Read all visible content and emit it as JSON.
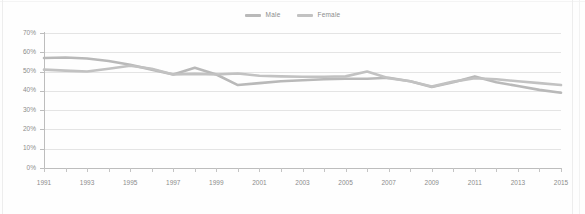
{
  "chart_data": {
    "type": "line",
    "title": "",
    "xlabel": "",
    "ylabel": "",
    "ylim": [
      0,
      70
    ],
    "ytick_labels": [
      "0%",
      "10%",
      "20%",
      "30%",
      "40%",
      "50%",
      "60%",
      "70%"
    ],
    "ytick_values": [
      0,
      10,
      20,
      30,
      40,
      50,
      60,
      70
    ],
    "grid": true,
    "legend_position": "top-center",
    "x": [
      1991,
      1992,
      1993,
      1994,
      1995,
      1996,
      1997,
      1998,
      1999,
      2000,
      2001,
      2002,
      2003,
      2004,
      2005,
      2006,
      2007,
      2008,
      2009,
      2010,
      2011,
      2012,
      2013,
      2014,
      2015
    ],
    "xtick_labels": [
      "1991",
      "",
      "1993",
      "",
      "1995",
      "",
      "1997",
      "",
      "1999",
      "",
      "2001",
      "",
      "2003",
      "",
      "2005",
      "",
      "2007",
      "",
      "2009",
      "",
      "2011",
      "",
      "2013",
      "",
      "2015"
    ],
    "series": [
      {
        "name": "Male",
        "color": "#b9b9b9",
        "values": [
          57.0,
          57.3,
          56.8,
          55.5,
          53.5,
          51.0,
          48.5,
          52.0,
          48.5,
          43.0,
          44.0,
          45.0,
          45.5,
          46.0,
          46.3,
          46.3,
          46.8,
          45.0,
          42.0,
          44.5,
          47.5,
          44.5,
          42.5,
          40.5,
          39.0
        ]
      },
      {
        "name": "Female",
        "color": "#c2c2c2",
        "values": [
          51.0,
          50.5,
          50.0,
          51.5,
          53.0,
          51.5,
          48.5,
          48.8,
          48.5,
          49.0,
          47.8,
          47.5,
          47.3,
          47.3,
          47.5,
          50.0,
          46.5,
          45.0,
          42.2,
          44.8,
          46.5,
          46.0,
          45.0,
          44.0,
          43.0
        ]
      }
    ]
  },
  "legend": {
    "items": [
      {
        "label": "Male",
        "color": "#b9b9b9"
      },
      {
        "label": "Female",
        "color": "#c2c2c2"
      }
    ]
  },
  "colors": {
    "gridline": "#e4e4e4",
    "axis": "#bdbdbd",
    "tick_text": "#8c8c8c",
    "background": "#fefefe"
  }
}
